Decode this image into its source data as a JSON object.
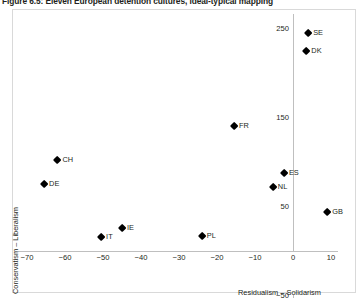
{
  "figure": {
    "title": "Figure 6.5: Eleven European detention cultures, ideal-typical mapping"
  },
  "chart_data": {
    "type": "scatter",
    "title": "Figure 6.5: Eleven European detention cultures, ideal-typical mapping",
    "xlabel": "Residualism – Solidarism",
    "ylabel": "Conservatism – Liberalism",
    "xlim": [
      -75,
      14
    ],
    "ylim": [
      -50,
      250
    ],
    "xticks": [
      -70,
      -60,
      -50,
      -40,
      -30,
      -20,
      -10,
      0,
      10
    ],
    "xtick_labels": [
      "−70",
      "−60",
      "−50",
      "−40",
      "−30",
      "−20",
      "−10",
      "0",
      "10"
    ],
    "yticks": [
      250,
      150,
      50,
      -50
    ],
    "ytick_labels": [
      "250",
      "150",
      "50",
      "−50"
    ],
    "grid": false,
    "legend": false,
    "marker": "diamond",
    "marker_color": "#000000",
    "points": [
      {
        "label": "SE",
        "x": 4,
        "y": 245
      },
      {
        "label": "DK",
        "x": 3.5,
        "y": 225
      },
      {
        "label": "FR",
        "x": -15.5,
        "y": 141
      },
      {
        "label": "ES",
        "x": -2.4,
        "y": 88
      },
      {
        "label": "NL",
        "x": -5.3,
        "y": 72
      },
      {
        "label": "GB",
        "x": 9,
        "y": 44
      },
      {
        "label": "CH",
        "x": -62,
        "y": 103
      },
      {
        "label": "DE",
        "x": -65.5,
        "y": 76
      },
      {
        "label": "IE",
        "x": -45,
        "y": 26
      },
      {
        "label": "IT",
        "x": -50.5,
        "y": 16
      },
      {
        "label": "PL",
        "x": -24,
        "y": 17
      }
    ]
  }
}
